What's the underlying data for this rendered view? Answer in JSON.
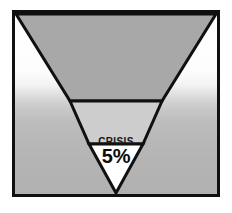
{
  "figure": {
    "type": "inverted-pyramid-funnel",
    "frame": {
      "border_color": "#101010",
      "border_width_px": 3
    },
    "background": {
      "style": "vertical metallic gradient",
      "top_color": "#ffffff",
      "mid_highlight_color": "#cfcfcf",
      "bottom_color": "#b1b1b1"
    },
    "outline_color": "#101010",
    "bands": [
      {
        "id": "band-top",
        "label": "",
        "value": "",
        "fill": "#a8a8a8"
      },
      {
        "id": "band-middle",
        "label": "",
        "value": "",
        "fill": "#cdcdcd"
      },
      {
        "id": "band-apex",
        "label": "CRISIS",
        "value": "5%",
        "fill": "#ffffff"
      }
    ]
  }
}
